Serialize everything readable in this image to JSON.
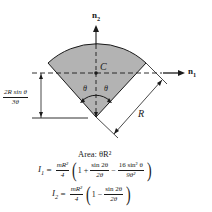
{
  "diagram": {
    "type": "circular-sector-inertia",
    "axes": {
      "n1_label": "n",
      "n1_sub": "1",
      "n2_label": "n",
      "n2_sub": "2"
    },
    "centroid_label": "C",
    "angle_label_left": "θ",
    "angle_label_right": "θ",
    "radius_label": "R",
    "offset_dimension": {
      "numerator": "2R sin θ",
      "denominator": "3θ"
    },
    "colors": {
      "sector_fill": "#b3b3b3",
      "stroke": "#1a1a1a",
      "background": "#ffffff"
    }
  },
  "formulas": {
    "area": "Area: θR²",
    "I1": {
      "lhs": "I",
      "lhs_sub": "1",
      "coef_num": "mR²",
      "coef_den": "4",
      "term1": "1 +",
      "frac1_num": "sin 2θ",
      "frac1_den": "2θ",
      "op": "−",
      "frac2_num": "16 sin² θ",
      "frac2_den": "9θ²"
    },
    "I2": {
      "lhs": "I",
      "lhs_sub": "2",
      "coef_num": "mR²",
      "coef_den": "4",
      "term1": "1 −",
      "frac1_num": "sin 2θ",
      "frac1_den": "2θ"
    }
  }
}
